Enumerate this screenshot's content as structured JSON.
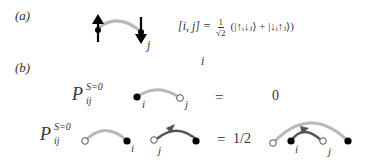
{
  "panels": {
    "a": {
      "label": "(a)",
      "site_label_j": "j",
      "site_label_i": "i",
      "equation_lhs": "[i, j] =",
      "equation_frac_num": "1",
      "equation_frac_den": "√2",
      "equation_rhs": "(|↑ᵢ↓ⱼ⟩ + |↓ᵢ↑ⱼ⟩)"
    },
    "b": {
      "label": "(b)",
      "row1": {
        "operator": "P",
        "operator_sup": "S=0",
        "operator_sub": "ij",
        "label_i": "i",
        "label_j": "j",
        "equals": "=",
        "result": "0"
      },
      "row2": {
        "operator": "P",
        "operator_sup": "S=0",
        "operator_sub": "ij",
        "label_i": "i",
        "label_j": "j",
        "equals": "=",
        "result": "1/2",
        "rhs_label_i": "i",
        "rhs_label_j": "j"
      }
    }
  },
  "colors": {
    "bond_light": "#b8b8b8",
    "bond_dark": "#555555",
    "filled_dot": "#000000",
    "open_dot_stroke": "#555555"
  }
}
